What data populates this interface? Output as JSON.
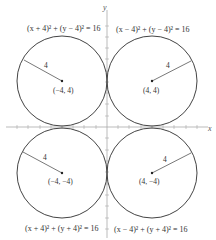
{
  "diagram": {
    "axes": {
      "x_label": "x",
      "y_label": "y"
    },
    "circles": [
      {
        "id": "top-left",
        "equation": "(x + 4)² + (y − 4)² = 16",
        "center_label": "(−4, 4)",
        "radius_label": "4"
      },
      {
        "id": "top-right",
        "equation": "(x − 4)² + (y − 4)² = 16",
        "center_label": "(4, 4)",
        "radius_label": "4"
      },
      {
        "id": "bottom-left",
        "equation": "(x + 4)² + (y + 4)² = 16",
        "center_label": "(−4, −4)",
        "radius_label": "4"
      },
      {
        "id": "bottom-right",
        "equation": "(x − 4)² + (y + 4)² = 16",
        "center_label": "(4, −4)",
        "radius_label": "4"
      }
    ]
  }
}
